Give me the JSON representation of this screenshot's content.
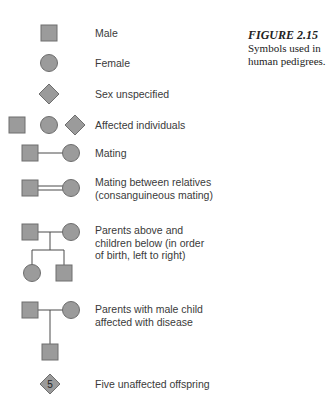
{
  "caption": {
    "title": "FIGURE 2.15",
    "lines": [
      "Symbols used in",
      "human pedigrees."
    ]
  },
  "colors": {
    "fill": "#9b9b9b",
    "stroke": "#6e6e6e",
    "line": "#4a4a4a",
    "text": "#3a3a3a"
  },
  "legend": [
    {
      "symbol": "square",
      "label": "Male"
    },
    {
      "symbol": "circle",
      "label": "Female"
    },
    {
      "symbol": "diamond",
      "label": "Sex unspecified"
    },
    {
      "symbol": "square-circle-diamond",
      "label": "Affected individuals"
    },
    {
      "symbol": "mating-line",
      "label": "Mating"
    },
    {
      "symbol": "double-mating-line",
      "label": [
        "Mating between relatives",
        "(consanguineous mating)"
      ]
    },
    {
      "symbol": "parents-children",
      "label": [
        "Parents above and",
        "children below (in order",
        "of birth, left to right)"
      ]
    },
    {
      "symbol": "parents-affected-male-child",
      "label": [
        "Parents with male child",
        "affected with disease"
      ]
    },
    {
      "symbol": "diamond-number",
      "number": "5",
      "label": "Five unaffected offspring"
    }
  ]
}
